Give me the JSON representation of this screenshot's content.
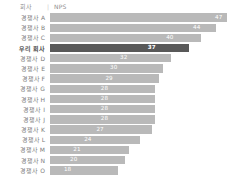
{
  "header": {
    "category_label": "회사",
    "separator": "|",
    "value_label": "NPS"
  },
  "colors": {
    "bar_default": "#b9b9b9",
    "bar_highlight": "#595959",
    "value_text": "#ffffff",
    "label_text": "#7d7d7d",
    "background": "#ffffff"
  },
  "chart_data": {
    "type": "bar",
    "orientation": "horizontal",
    "title": "",
    "subtitle": "",
    "xlabel": "NPS",
    "ylabel": "회사",
    "grid": false,
    "legend": false,
    "xlim": [
      0,
      47
    ],
    "categories": [
      "경쟁사 A",
      "경쟁사 B",
      "경쟁사 C",
      "우리 회사",
      "경쟁사 D",
      "경쟁사 E",
      "경쟁사 F",
      "경쟁사 G",
      "경쟁사 H",
      "경쟁사 I",
      "경쟁사 J",
      "경쟁사 K",
      "경쟁사 L",
      "경쟁사 M",
      "경쟁사 N",
      "경쟁사 O"
    ],
    "values": [
      47,
      44,
      40,
      37,
      32,
      30,
      29,
      28,
      28,
      28,
      28,
      27,
      24,
      21,
      20,
      18
    ],
    "highlight_index": 3,
    "rows": [
      {
        "label": "경쟁사 A",
        "value": 47,
        "display": "47",
        "highlight": false
      },
      {
        "label": "경쟁사 B",
        "value": 44,
        "display": "44",
        "highlight": false
      },
      {
        "label": "경쟁사 C",
        "value": 40,
        "display": "40",
        "highlight": false
      },
      {
        "label": "우리 회사",
        "value": 37,
        "display": "37",
        "highlight": true
      },
      {
        "label": "경쟁사 D",
        "value": 32,
        "display": "32",
        "highlight": false
      },
      {
        "label": "경쟁사 E",
        "value": 30,
        "display": "30",
        "highlight": false
      },
      {
        "label": "경쟁사 F",
        "value": 29,
        "display": "29",
        "highlight": false
      },
      {
        "label": "경쟁사 G",
        "value": 28,
        "display": "28",
        "highlight": false
      },
      {
        "label": "경쟁사 H",
        "value": 28,
        "display": "28",
        "highlight": false
      },
      {
        "label": "경쟁사 I",
        "value": 28,
        "display": "28",
        "highlight": false
      },
      {
        "label": "경쟁사 J",
        "value": 28,
        "display": "28",
        "highlight": false
      },
      {
        "label": "경쟁사 K",
        "value": 27,
        "display": "27",
        "highlight": false
      },
      {
        "label": "경쟁사 L",
        "value": 24,
        "display": "24",
        "highlight": false
      },
      {
        "label": "경쟁사 M",
        "value": 21,
        "display": "21",
        "highlight": false
      },
      {
        "label": "경쟁사 N",
        "value": 20,
        "display": "20",
        "highlight": false
      },
      {
        "label": "경쟁사 O",
        "value": 18,
        "display": "18",
        "highlight": false
      }
    ]
  }
}
